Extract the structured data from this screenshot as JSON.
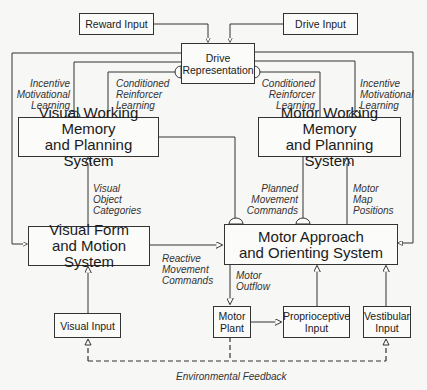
{
  "diagram": {
    "boxes": {
      "reward_input": "Reward Input",
      "drive_input": "Drive Input",
      "drive_representation": "Drive\nRepresentation",
      "visual_wm": "Visual Working Memory\nand Planning System",
      "motor_wm": "Motor Working Memory\nand Planning System",
      "visual_form": "Visual Form\nand Motion System",
      "motor_approach": "Motor Approach\nand Orienting System",
      "visual_input": "Visual Input",
      "motor_plant": "Motor\nPlant",
      "proprioceptive_input": "Proprioceptive\nInput",
      "vestibular_input": "Vestibular\nInput"
    },
    "labels": {
      "incentive_left": "Incentive\nMotivational\nLearning",
      "conditioned_left": "Conditioned\nReinforcer\nLearning",
      "conditioned_right": "Conditioned\nReinforcer\nLearning",
      "incentive_right": "Incentive\nMotivational\nLearning",
      "visual_object_categories": "Visual\nObject\nCategories",
      "planned_movement_commands": "Planned\nMovement\nCommands",
      "motor_map_positions": "Motor\nMap\nPositions",
      "reactive_movement_commands": "Reactive\nMovement\nCommands",
      "motor_outflow": "Motor\nOutflow",
      "environmental_feedback": "Environmental Feedback"
    },
    "colors": {
      "line": "#333333",
      "box_border": "#333333",
      "background": "#f7f7f5"
    }
  }
}
